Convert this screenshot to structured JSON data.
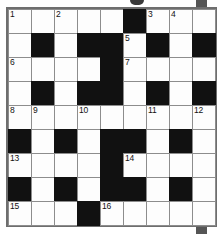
{
  "puzzle": {
    "type": "crossword-grid",
    "title": "Crossword Puzzle Grid",
    "rows": 9,
    "columns": 9,
    "colors": {
      "white_cell": "#fdfdfd",
      "black_cell": "#111111",
      "grid_line": "#8d8d8d",
      "frame": "#6e6e6e",
      "number_text": "#121212",
      "page_background": "#ffffff"
    },
    "grid": [
      [
        {
          "state": "white",
          "number": "1"
        },
        {
          "state": "white",
          "number": ""
        },
        {
          "state": "white",
          "number": "2"
        },
        {
          "state": "white",
          "number": ""
        },
        {
          "state": "white",
          "number": ""
        },
        {
          "state": "black",
          "number": ""
        },
        {
          "state": "white",
          "number": "3"
        },
        {
          "state": "white",
          "number": "4"
        },
        {
          "state": "white",
          "number": ""
        }
      ],
      [
        {
          "state": "white",
          "number": ""
        },
        {
          "state": "black",
          "number": ""
        },
        {
          "state": "white",
          "number": ""
        },
        {
          "state": "black",
          "number": ""
        },
        {
          "state": "black",
          "number": ""
        },
        {
          "state": "white",
          "number": "5"
        },
        {
          "state": "black",
          "number": ""
        },
        {
          "state": "white",
          "number": ""
        },
        {
          "state": "black",
          "number": ""
        }
      ],
      [
        {
          "state": "white",
          "number": "6"
        },
        {
          "state": "white",
          "number": ""
        },
        {
          "state": "white",
          "number": ""
        },
        {
          "state": "white",
          "number": ""
        },
        {
          "state": "black",
          "number": ""
        },
        {
          "state": "white",
          "number": "7"
        },
        {
          "state": "white",
          "number": ""
        },
        {
          "state": "white",
          "number": ""
        },
        {
          "state": "white",
          "number": ""
        }
      ],
      [
        {
          "state": "white",
          "number": ""
        },
        {
          "state": "black",
          "number": ""
        },
        {
          "state": "white",
          "number": ""
        },
        {
          "state": "black",
          "number": ""
        },
        {
          "state": "black",
          "number": ""
        },
        {
          "state": "white",
          "number": ""
        },
        {
          "state": "black",
          "number": ""
        },
        {
          "state": "white",
          "number": ""
        },
        {
          "state": "black",
          "number": ""
        }
      ],
      [
        {
          "state": "white",
          "number": "8"
        },
        {
          "state": "white",
          "number": "9"
        },
        {
          "state": "white",
          "number": ""
        },
        {
          "state": "white",
          "number": "10"
        },
        {
          "state": "white",
          "number": ""
        },
        {
          "state": "white",
          "number": ""
        },
        {
          "state": "white",
          "number": "11"
        },
        {
          "state": "white",
          "number": ""
        },
        {
          "state": "white",
          "number": "12"
        }
      ],
      [
        {
          "state": "black",
          "number": ""
        },
        {
          "state": "white",
          "number": ""
        },
        {
          "state": "black",
          "number": ""
        },
        {
          "state": "white",
          "number": ""
        },
        {
          "state": "black",
          "number": ""
        },
        {
          "state": "black",
          "number": ""
        },
        {
          "state": "white",
          "number": ""
        },
        {
          "state": "black",
          "number": ""
        },
        {
          "state": "white",
          "number": ""
        }
      ],
      [
        {
          "state": "white",
          "number": "13"
        },
        {
          "state": "white",
          "number": ""
        },
        {
          "state": "white",
          "number": ""
        },
        {
          "state": "white",
          "number": ""
        },
        {
          "state": "black",
          "number": ""
        },
        {
          "state": "white",
          "number": "14"
        },
        {
          "state": "white",
          "number": ""
        },
        {
          "state": "white",
          "number": ""
        },
        {
          "state": "white",
          "number": ""
        }
      ],
      [
        {
          "state": "black",
          "number": ""
        },
        {
          "state": "white",
          "number": ""
        },
        {
          "state": "black",
          "number": ""
        },
        {
          "state": "white",
          "number": ""
        },
        {
          "state": "black",
          "number": ""
        },
        {
          "state": "black",
          "number": ""
        },
        {
          "state": "white",
          "number": ""
        },
        {
          "state": "black",
          "number": ""
        },
        {
          "state": "white",
          "number": ""
        }
      ],
      [
        {
          "state": "white",
          "number": "15"
        },
        {
          "state": "white",
          "number": ""
        },
        {
          "state": "white",
          "number": ""
        },
        {
          "state": "black",
          "number": ""
        },
        {
          "state": "white",
          "number": "16"
        },
        {
          "state": "white",
          "number": ""
        },
        {
          "state": "white",
          "number": ""
        },
        {
          "state": "white",
          "number": ""
        },
        {
          "state": "white",
          "number": ""
        }
      ]
    ]
  }
}
